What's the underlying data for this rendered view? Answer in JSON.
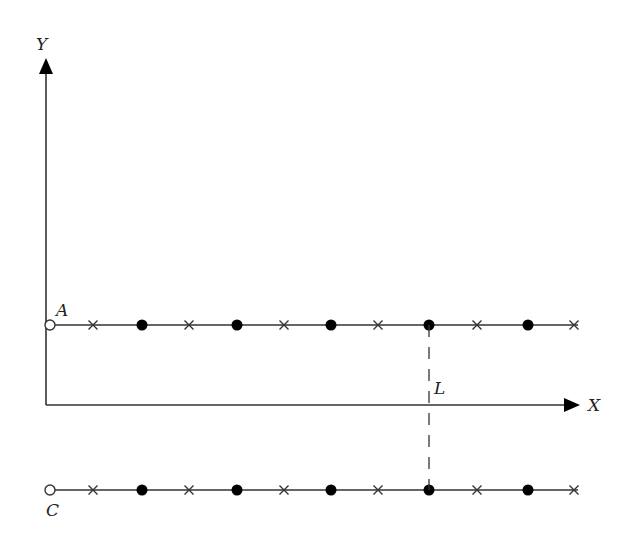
{
  "diagram": {
    "axes": {
      "x_label": "X",
      "y_label": "Y",
      "origin": [
        46,
        405
      ],
      "x_end": 580,
      "y_top": 58
    },
    "rows": [
      {
        "name": "row-a",
        "label": "A",
        "y": 325,
        "start_x": 50,
        "end_x": 578,
        "label_pos": [
          56,
          316
        ]
      },
      {
        "name": "row-c",
        "label": "C",
        "y": 490,
        "start_x": 50,
        "end_x": 578,
        "label_pos": [
          46,
          516
        ]
      }
    ],
    "markers": [
      {
        "type": "cross",
        "x": 93
      },
      {
        "type": "dot",
        "x": 142
      },
      {
        "type": "cross",
        "x": 189
      },
      {
        "type": "dot",
        "x": 237
      },
      {
        "type": "cross",
        "x": 284
      },
      {
        "type": "dot",
        "x": 331
      },
      {
        "type": "cross",
        "x": 378
      },
      {
        "type": "dot",
        "x": 429
      },
      {
        "type": "cross",
        "x": 477
      },
      {
        "type": "dot",
        "x": 528
      },
      {
        "type": "cross",
        "x": 574
      }
    ],
    "dashed_line": {
      "label": "L",
      "x": 429,
      "y1": 325,
      "y2": 490,
      "label_pos": [
        434,
        394
      ]
    },
    "colors": {
      "line": "#333333",
      "fill": "#000000"
    }
  }
}
